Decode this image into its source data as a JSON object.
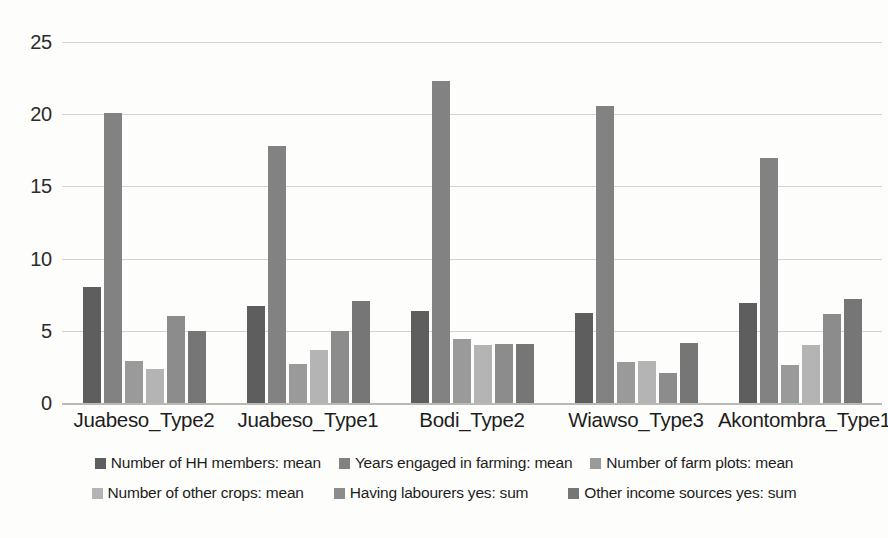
{
  "chart_data": {
    "type": "bar",
    "title": "",
    "xlabel": "",
    "ylabel": "",
    "ylim": [
      0,
      25
    ],
    "yticks": [
      0,
      5,
      10,
      15,
      20,
      25
    ],
    "grid": true,
    "legend_position": "bottom",
    "categories": [
      "Juabeso_Type2",
      "Juabeso_Type1",
      "Bodi_Type2",
      "Wiawso_Type3",
      "Akontombra_Type1"
    ],
    "series": [
      {
        "name": "Number of HH members: mean",
        "color": "#5e5e5e",
        "values": [
          8.0,
          6.7,
          6.4,
          6.2,
          6.9
        ]
      },
      {
        "name": "Years engaged in farming: mean",
        "color": "#828282",
        "values": [
          20.1,
          17.8,
          22.3,
          20.6,
          17.0
        ]
      },
      {
        "name": "Number of farm plots: mean",
        "color": "#9a9a9a",
        "values": [
          2.9,
          2.7,
          4.4,
          2.85,
          2.6
        ]
      },
      {
        "name": "Number of other crops: mean",
        "color": "#b4b4b4",
        "values": [
          2.35,
          3.7,
          4.0,
          2.9,
          4.0
        ]
      },
      {
        "name": "Having  labourers yes: sum",
        "color": "#8c8c8c",
        "values": [
          6.0,
          5.0,
          4.1,
          2.1,
          6.15
        ]
      },
      {
        "name": "Other income sources yes: sum",
        "color": "#767676",
        "values": [
          5.0,
          7.05,
          4.1,
          4.15,
          7.2
        ]
      }
    ]
  },
  "legend": {
    "row1": [
      "Number of HH members: mean",
      "Years engaged in farming: mean",
      "Number of farm plots: mean"
    ],
    "row2": [
      "Number of other crops: mean",
      "Having  labourers yes: sum",
      "Other income sources yes: sum"
    ]
  }
}
